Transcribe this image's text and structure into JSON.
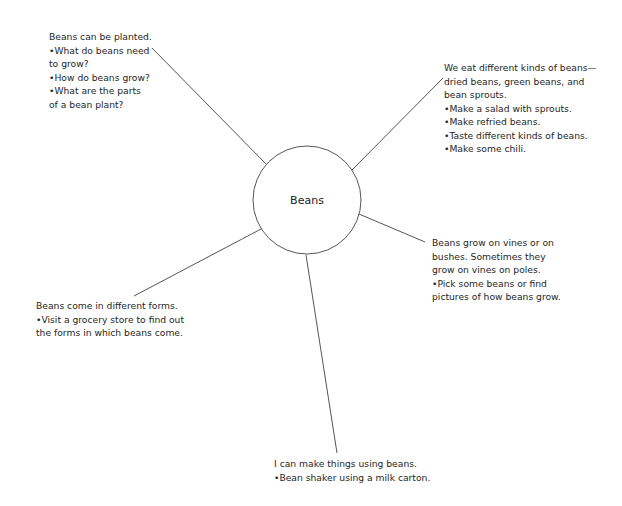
{
  "center": {
    "label": "Beans",
    "cx": 307,
    "cy": 200,
    "r": 54
  },
  "line_color": "#555555",
  "branches": [
    {
      "id": "planted",
      "lines": [
        "Beans can be planted.",
        "•What do beans need",
        "to grow?",
        "•How do beans grow?",
        "•What are the parts",
        "of a bean plant?"
      ],
      "box": {
        "x": 49,
        "y": 30
      },
      "connector": {
        "x1": 152,
        "y1": 48,
        "x2": 266,
        "y2": 164
      }
    },
    {
      "id": "eat",
      "lines": [
        "We eat different kinds of beans—",
        "dried beans, green beans, and",
        "bean sprouts.",
        "•Make a salad with sprouts.",
        "•Make refried beans.",
        "•Taste different kinds of beans.",
        "•Make some chili."
      ],
      "box": {
        "x": 444,
        "y": 61
      },
      "connector": {
        "x1": 443,
        "y1": 78,
        "x2": 352,
        "y2": 170
      }
    },
    {
      "id": "grow",
      "lines": [
        "Beans grow on vines or on",
        "bushes.  Sometimes they",
        "grow on vines on poles.",
        "•Pick some beans or find",
        "pictures of how beans grow."
      ],
      "box": {
        "x": 432,
        "y": 236
      },
      "connector": {
        "x1": 359,
        "y1": 214,
        "x2": 425,
        "y2": 242
      }
    },
    {
      "id": "forms",
      "lines": [
        "Beans come in different forms.",
        "•Visit a grocery store to find out",
        "the forms in which beans come."
      ],
      "box": {
        "x": 36,
        "y": 299
      },
      "connector": {
        "x1": 134,
        "y1": 296,
        "x2": 261,
        "y2": 229
      }
    },
    {
      "id": "make",
      "lines": [
        "I can make things using beans.",
        "•Bean shaker using a milk carton."
      ],
      "box": {
        "x": 274,
        "y": 457
      },
      "connector": {
        "x1": 306,
        "y1": 255,
        "x2": 337,
        "y2": 453
      }
    }
  ]
}
